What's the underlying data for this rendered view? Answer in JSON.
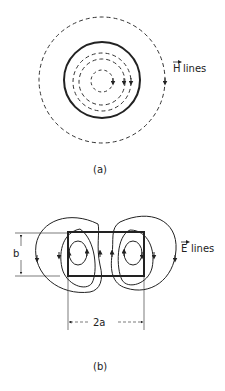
{
  "figure_a": {
    "caption": "(a)",
    "field_label_symbol": "H",
    "field_label_text": "lines",
    "description": "Magnetic field lines: concentric dashed circles inside and outside a solid circular conductor"
  },
  "figure_b": {
    "caption": "(b)",
    "field_label_symbol": "E",
    "field_label_text": "lines",
    "height_dimension": "b",
    "width_dimension": "2a",
    "description": "Electric field lines: closed loops around a rectangular cross-section"
  },
  "colors": {
    "line": "#222222",
    "background": "#ffffff"
  }
}
